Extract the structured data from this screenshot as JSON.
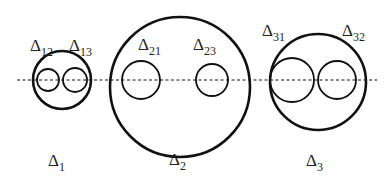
{
  "diagram": {
    "axis": {
      "x1": 17,
      "x2": 377,
      "y": 80,
      "style": "dashed"
    },
    "groups": [
      {
        "label": "Δ",
        "label_sub": "1",
        "label_pos": [
          48,
          166
        ],
        "outer": {
          "cx": 62,
          "cy": 80,
          "r": 29
        },
        "inner": [
          {
            "cx": 48,
            "cy": 80,
            "r": 11,
            "label": "Δ",
            "sub": "12",
            "label_pos": [
              30,
              51
            ]
          },
          {
            "cx": 75,
            "cy": 80,
            "r": 12,
            "label": "Δ",
            "sub": "13",
            "label_pos": [
              69,
              51
            ]
          }
        ]
      },
      {
        "label": "Δ",
        "label_sub": "2",
        "label_pos": [
          169,
          165
        ],
        "outer": {
          "cx": 180,
          "cy": 87,
          "r": 70
        },
        "inner": [
          {
            "cx": 141,
            "cy": 80,
            "r": 19,
            "label": "Δ",
            "sub": "21",
            "label_pos": [
              138,
              50
            ]
          },
          {
            "cx": 212,
            "cy": 80,
            "r": 16,
            "label": "Δ",
            "sub": "23",
            "label_pos": [
              193,
              50
            ]
          }
        ]
      },
      {
        "label": "Δ",
        "label_sub": "3",
        "label_pos": [
          306,
          166
        ],
        "outer": {
          "cx": 318,
          "cy": 82,
          "r": 48
        },
        "inner": [
          {
            "cx": 292,
            "cy": 80,
            "r": 22,
            "label": "Δ",
            "sub": "31",
            "label_pos": [
              262,
              36
            ]
          },
          {
            "cx": 337,
            "cy": 80,
            "r": 19,
            "label": "Δ",
            "sub": "32",
            "label_pos": [
              342,
              36
            ]
          }
        ]
      }
    ],
    "colors": {
      "stroke": "#111111",
      "text": "#222222"
    }
  }
}
